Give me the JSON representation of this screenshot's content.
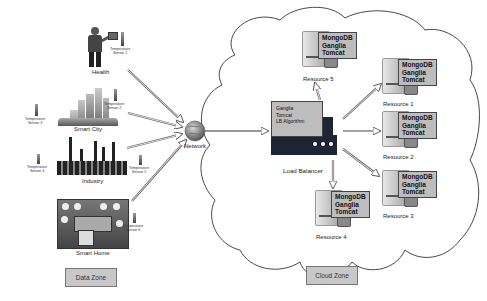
{
  "data_zone": {
    "label": "Data Zone",
    "domains": [
      {
        "name": "Health",
        "sensors": [
          "Temperature Sensor 1"
        ]
      },
      {
        "name": "Smart City",
        "sensors": [
          "Temperature Sensor 2",
          "Temperature Sensor 3"
        ]
      },
      {
        "name": "Industry",
        "sensors": [
          "Temperature Sensor 4",
          "Temperature Sensor 5"
        ]
      },
      {
        "name": "Smart Home",
        "sensors": [
          "Temperature Sensor 6"
        ]
      }
    ],
    "sensor_labels": {
      "s1": [
        "Temperature",
        "Sensor 1"
      ],
      "s2": [
        "Temperature",
        "Sensor 2"
      ],
      "s3": [
        "Temperature",
        "Sensor 3"
      ],
      "s4": [
        "Temperature",
        "Sensor 4"
      ],
      "s5": [
        "Temperature",
        "Sensor 5"
      ],
      "s6": [
        "Temperature",
        "Sensor 6"
      ]
    }
  },
  "network": {
    "label": "Network"
  },
  "cloud_zone": {
    "label": "Cloud Zone",
    "load_balancer": {
      "label": "Load Balancer",
      "stack": [
        "Ganglia",
        "Tomcat",
        "LB Algorithm"
      ]
    },
    "resources": [
      {
        "name": "Resource 1",
        "stack": [
          "MongoDB",
          "Ganglia",
          "Tomcat"
        ]
      },
      {
        "name": "Resource 2",
        "stack": [
          "MongoDB",
          "Ganglia",
          "Tomcat"
        ]
      },
      {
        "name": "Resource 3",
        "stack": [
          "MongoDB",
          "Ganglia",
          "Tomcat"
        ]
      },
      {
        "name": "Resource 4",
        "stack": [
          "MongoDB",
          "Ganglia",
          "Tomcat"
        ]
      },
      {
        "name": "Resource 5",
        "stack": [
          "MongoDB",
          "Ganglia",
          "Tomcat"
        ]
      }
    ]
  },
  "colors": {
    "zone_box": "#c8c8c8",
    "stack_box": "#bdbdbd",
    "lb_body": "#1e2433",
    "arrow": "#777777"
  }
}
